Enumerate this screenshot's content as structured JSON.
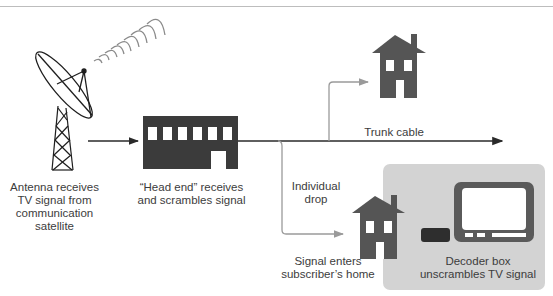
{
  "diagram": {
    "colors": {
      "house": "#555555",
      "head_end": "#3b3b3b",
      "trunk_line": "#2a2a2a",
      "branch_line": "#9a9a9a",
      "decoder_panel": "#d3d3d3",
      "decoder_box": "#2e2e2e",
      "tv_frame": "#5a5a5a"
    },
    "nodes": [
      {
        "id": "antenna",
        "label": "Antenna receives\nTV signal from\ncommunication\nsatellite"
      },
      {
        "id": "head_end",
        "label": "“Head end” receives\nand scrambles signal"
      },
      {
        "id": "house_top",
        "label": ""
      },
      {
        "id": "subscriber_home",
        "label": "Signal enters\nsubscriber’s home"
      },
      {
        "id": "decoder",
        "label": "Decoder box\nunscrambles TV signal"
      }
    ],
    "edges": [
      {
        "from": "antenna",
        "to": "head_end",
        "label": ""
      },
      {
        "from": "head_end",
        "to": "trunk_end",
        "label": "Trunk cable"
      },
      {
        "from": "trunk",
        "to": "house_top",
        "label": ""
      },
      {
        "from": "head_end",
        "to": "subscriber_home",
        "label": "Individual\ndrop"
      }
    ]
  },
  "labels": {
    "antenna": "Antenna receives\nTV signal from\ncommunication\nsatellite",
    "head_end": "“Head end” receives\nand scrambles signal",
    "trunk_cable": "Trunk cable",
    "individual_drop": "Individual\ndrop",
    "subscriber_home": "Signal enters\nsubscriber’s home",
    "decoder": "Decoder box\nunscrambles TV signal"
  }
}
